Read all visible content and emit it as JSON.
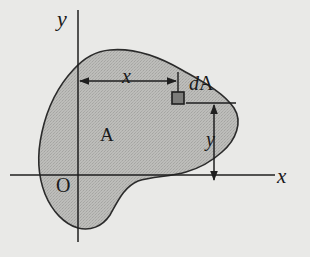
{
  "figure": {
    "type": "engineering-diagram",
    "background_color": "#e9e9e7",
    "outline_color": "#2b2b2b",
    "area_fill_color": "#b9b9b6",
    "element_fill_color": "#787876",
    "canvas": {
      "width": 310,
      "height": 257
    }
  },
  "axes": {
    "y_label": "y",
    "x_label": "x",
    "origin_label": "O",
    "y_axis": {
      "x": 78,
      "y_top": 10,
      "y_bottom": 242
    },
    "x_axis": {
      "y": 175,
      "x_left": 10,
      "x_right": 275
    }
  },
  "region": {
    "area_label": "A",
    "element_label_d": "d",
    "element_label_A": "A",
    "element_label_full": "dA"
  },
  "dimensions": [
    {
      "name": "horizontal-distance",
      "label": "x",
      "orientation": "horizontal",
      "from_x": 80,
      "to_x": 178,
      "y": 81,
      "arrow_style": "double"
    },
    {
      "name": "vertical-distance",
      "label": "y",
      "orientation": "vertical",
      "x": 214,
      "from_y": 103,
      "to_y": 182,
      "arrow_style": "double"
    }
  ],
  "element": {
    "name": "dA",
    "x": 172,
    "y": 92,
    "size": 12
  }
}
